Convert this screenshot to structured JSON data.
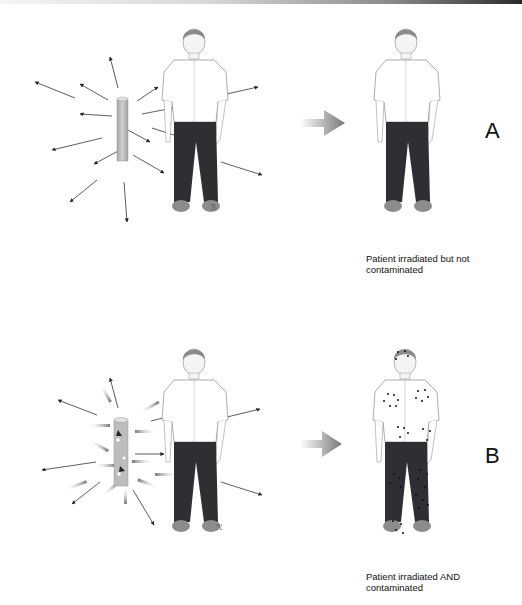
{
  "figure": {
    "panels": [
      {
        "letter": "A",
        "caption_line1": "Patient irradiated but not",
        "caption_line2": "contaminated",
        "source": "intact sealed source",
        "patient_right": "clean patient"
      },
      {
        "letter": "B",
        "caption_line1": "Patient irradiated AND",
        "caption_line2": "contaminated",
        "source": "leaking source",
        "patient_right": "contaminated patient"
      }
    ],
    "colors": {
      "shirt": "#ffffff",
      "pants": "#2f2f33",
      "hair": "#8a8a8a",
      "shoes": "#8c8c8c",
      "source": "#bdbdbd",
      "arrow": "#222222",
      "contamination_dot": "#111111"
    }
  }
}
